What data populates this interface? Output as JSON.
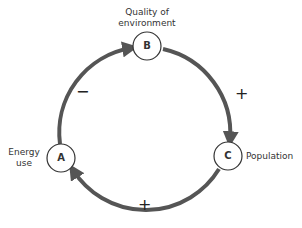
{
  "diagram": {
    "type": "causal-loop",
    "nodes": [
      {
        "id": "A",
        "letter": "A",
        "label_line1": "Energy",
        "label_line2": "use"
      },
      {
        "id": "B",
        "letter": "B",
        "label_line1": "Quality of",
        "label_line2": "environment"
      },
      {
        "id": "C",
        "letter": "C",
        "label": "Population"
      }
    ],
    "edges": [
      {
        "from": "A",
        "to": "B",
        "sign": "−"
      },
      {
        "from": "B",
        "to": "C",
        "sign": "+"
      },
      {
        "from": "C",
        "to": "A",
        "sign": "+"
      }
    ],
    "colors": {
      "arrow": "#555555",
      "node_stroke": "#333333",
      "text": "#333333"
    }
  }
}
